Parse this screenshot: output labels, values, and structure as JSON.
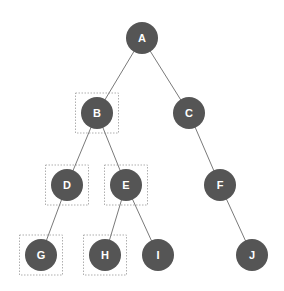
{
  "diagram": {
    "type": "binary-tree",
    "colors": {
      "node_fill": "#555555",
      "node_text": "#ffffff",
      "edge": "#7a7a7a",
      "highlight_box": "#9a9a9a",
      "background": "#ffffff"
    },
    "nodes": [
      {
        "id": "A",
        "label": "A",
        "x": 142,
        "y": 38,
        "highlighted": false
      },
      {
        "id": "B",
        "label": "B",
        "x": 97,
        "y": 113,
        "highlighted": true
      },
      {
        "id": "C",
        "label": "C",
        "x": 189,
        "y": 113,
        "highlighted": false
      },
      {
        "id": "D",
        "label": "D",
        "x": 67,
        "y": 185,
        "highlighted": true
      },
      {
        "id": "E",
        "label": "E",
        "x": 126,
        "y": 185,
        "highlighted": true
      },
      {
        "id": "F",
        "label": "F",
        "x": 220,
        "y": 185,
        "highlighted": false
      },
      {
        "id": "G",
        "label": "G",
        "x": 41,
        "y": 255,
        "highlighted": true
      },
      {
        "id": "H",
        "label": "H",
        "x": 105,
        "y": 255,
        "highlighted": true
      },
      {
        "id": "I",
        "label": "I",
        "x": 158,
        "y": 255,
        "highlighted": false
      },
      {
        "id": "J",
        "label": "J",
        "x": 252,
        "y": 255,
        "highlighted": false
      }
    ],
    "edges": [
      {
        "from": "A",
        "to": "B"
      },
      {
        "from": "A",
        "to": "C"
      },
      {
        "from": "B",
        "to": "D"
      },
      {
        "from": "B",
        "to": "E"
      },
      {
        "from": "C",
        "to": "F"
      },
      {
        "from": "D",
        "to": "G"
      },
      {
        "from": "E",
        "to": "H"
      },
      {
        "from": "E",
        "to": "I"
      },
      {
        "from": "F",
        "to": "J"
      }
    ]
  }
}
